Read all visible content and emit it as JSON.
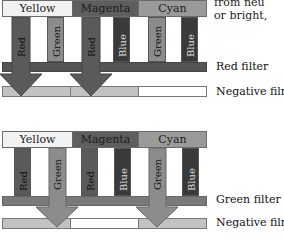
{
  "side_text": [
    "from neu",
    "or bright,"
  ],
  "diagrams": [
    {
      "filter_label": "Red filter",
      "film_label": "Negative film",
      "headers": [
        "Yellow",
        "Magenta",
        "Cyan"
      ],
      "bars": [
        "Red",
        "Green",
        "Red",
        "Blue",
        "Green",
        "Blue"
      ],
      "passes": [
        "Red",
        "Red"
      ],
      "film_segments": [
        "exposed",
        "exposed",
        "clear"
      ]
    },
    {
      "filter_label": "Green filter",
      "film_label": "Negative film",
      "headers": [
        "Yellow",
        "Magenta",
        "Cyan"
      ],
      "bars": [
        "Red",
        "Green",
        "Red",
        "Blue",
        "Green",
        "Blue"
      ],
      "passes": [
        "Green",
        "Green"
      ],
      "film_segments": [
        "exposed",
        "clear",
        "exposed"
      ]
    }
  ],
  "colors": {
    "yellow_layer": "#f2f2f2",
    "magenta_layer": "#5e5e5e",
    "cyan_layer": "#9a9a9a",
    "red_bar": "#5a5a5a",
    "green_bar": "#8c8c8c",
    "blue_bar": "#3a3a3a",
    "filter": "#555555",
    "film_exposed": "#c2c2c2",
    "film_clear": "#ffffff"
  }
}
